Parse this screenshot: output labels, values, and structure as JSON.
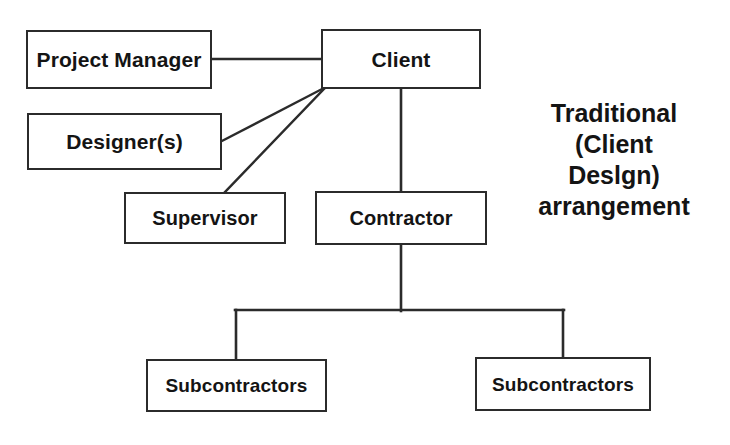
{
  "diagram": {
    "stroke_color": "#2b2b2b",
    "text_color": "#141414",
    "background_color": "#ffffff",
    "nodes": [
      {
        "id": "project_manager",
        "label": "Project Manager"
      },
      {
        "id": "client",
        "label": "Client"
      },
      {
        "id": "designers",
        "label": "Designer(s)"
      },
      {
        "id": "supervisor",
        "label": "Supervisor"
      },
      {
        "id": "contractor",
        "label": "Contractor"
      },
      {
        "id": "subcontractors_left",
        "label": "Subcontractors"
      },
      {
        "id": "subcontractors_right",
        "label": "Subcontractors"
      }
    ],
    "connections": [
      {
        "from": "client",
        "to": "project_manager",
        "style": "horizontal"
      },
      {
        "from": "client",
        "to": "designers",
        "style": "diagonal"
      },
      {
        "from": "client",
        "to": "supervisor",
        "style": "diagonal"
      },
      {
        "from": "client",
        "to": "contractor",
        "style": "vertical"
      },
      {
        "from": "contractor",
        "to": "subcontractors_left",
        "style": "bracket"
      },
      {
        "from": "contractor",
        "to": "subcontractors_right",
        "style": "bracket"
      }
    ],
    "caption": {
      "lines": [
        "Traditional",
        "(Client",
        "Deslgn)",
        "arrangement"
      ]
    }
  }
}
